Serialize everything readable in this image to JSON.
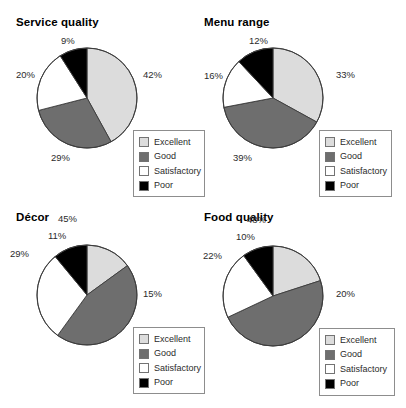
{
  "chart_data": [
    {
      "type": "pie",
      "title": "Service quality",
      "categories": [
        "Excellent",
        "Good",
        "Satisfactory",
        "Poor"
      ],
      "values": [
        42,
        29,
        20,
        9
      ],
      "labels": [
        "42%",
        "29%",
        "20%",
        "9%"
      ],
      "colors": [
        "#dcdcdc",
        "#6e6e6e",
        "#ffffff",
        "#000000"
      ],
      "legend_position": "bottom-right",
      "units": "percent"
    },
    {
      "type": "pie",
      "title": "Menu range",
      "categories": [
        "Excellent",
        "Good",
        "Satisfactory",
        "Poor"
      ],
      "values": [
        33,
        39,
        16,
        12
      ],
      "labels": [
        "33%",
        "39%",
        "16%",
        "12%"
      ],
      "colors": [
        "#dcdcdc",
        "#6e6e6e",
        "#ffffff",
        "#000000"
      ],
      "legend_position": "bottom-right",
      "units": "percent"
    },
    {
      "type": "pie",
      "title": "Décor",
      "categories": [
        "Excellent",
        "Good",
        "Satisfactory",
        "Poor"
      ],
      "values": [
        15,
        45,
        29,
        11
      ],
      "labels": [
        "15%",
        "45%",
        "29%",
        "11%"
      ],
      "colors": [
        "#dcdcdc",
        "#6e6e6e",
        "#ffffff",
        "#000000"
      ],
      "legend_position": "bottom-right",
      "units": "percent"
    },
    {
      "type": "pie",
      "title": "Food quality",
      "categories": [
        "Excellent",
        "Good",
        "Satisfactory",
        "Poor"
      ],
      "values": [
        20,
        48,
        22,
        10
      ],
      "labels": [
        "20%",
        "48%",
        "22%",
        "10%"
      ],
      "colors": [
        "#dcdcdc",
        "#6e6e6e",
        "#ffffff",
        "#000000"
      ],
      "legend_position": "bottom-right",
      "units": "percent"
    }
  ],
  "palette": {
    "excellent": "#dcdcdc",
    "good": "#6e6e6e",
    "satisfactory": "#ffffff",
    "poor": "#000000",
    "outline": "#3c3c3c",
    "legend_border": "#8d8d8d",
    "background": "#ffffff",
    "text": "#2b2b2b"
  },
  "label_offsets": [
    [
      {
        "x": 143,
        "y": 70
      },
      {
        "x": 51,
        "y": 153
      },
      {
        "x": 16,
        "y": 70
      },
      {
        "x": 61,
        "y": 36
      }
    ],
    [
      {
        "x": 133,
        "y": 70
      },
      {
        "x": 30,
        "y": 153
      },
      {
        "x": 1,
        "y": 71
      },
      {
        "x": 46,
        "y": 36
      }
    ],
    [
      {
        "x": 143,
        "y": 85
      },
      {
        "x": 58,
        "y": 10
      },
      {
        "x": 10,
        "y": 45
      },
      {
        "x": 48,
        "y": 27
      }
    ],
    [
      {
        "x": 133,
        "y": 85
      },
      {
        "x": 44,
        "y": 11
      },
      {
        "x": 0,
        "y": 47
      },
      {
        "x": 33,
        "y": 28
      }
    ]
  ]
}
